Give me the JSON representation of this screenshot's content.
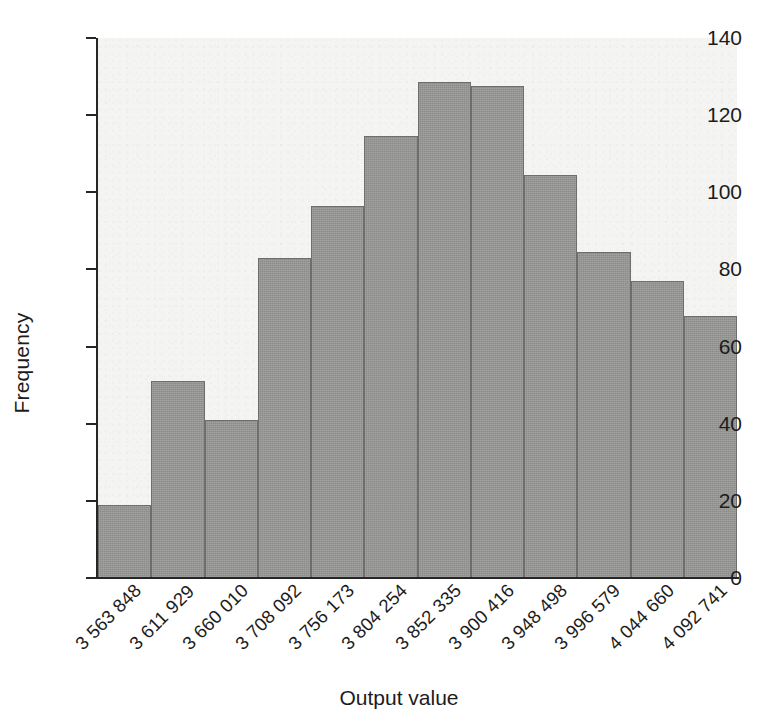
{
  "chart_data": {
    "type": "bar",
    "title": "",
    "xlabel": "Output value",
    "ylabel": "Frequency",
    "categories": [
      "3 563 848",
      "3 611 929",
      "3 660 010",
      "3 708 092",
      "3 756 173",
      "3 804 254",
      "3 852 335",
      "3 900 416",
      "3 948 498",
      "3 996 579",
      "4 044 660",
      "4 092 741"
    ],
    "values": [
      19,
      51,
      41,
      83,
      96.5,
      114.5,
      128.5,
      127.5,
      104.5,
      84.5,
      77,
      68
    ],
    "ylim": [
      0,
      140
    ],
    "yticks": [
      0,
      20,
      40,
      60,
      80,
      100,
      120,
      140
    ],
    "ytick_labels": [
      "0",
      "20",
      "40",
      "60",
      "80",
      "100",
      "120",
      "140"
    ],
    "grid": false,
    "legend": "none",
    "bar_color": "#999997",
    "bar_edge_color": "#6e6e6e",
    "panel_color": "#f4f4f2",
    "axis_color": "#262626",
    "text_color": "#1c1c1c"
  }
}
